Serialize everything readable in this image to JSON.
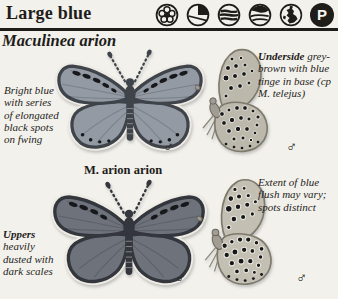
{
  "colors": {
    "paper": "#f2f1ec",
    "ink": "#1f1d1a",
    "wing_top": "#939aa4",
    "wing_top_margin": "#3f434a",
    "wing_bottom": "#6e727a",
    "wing_bottom_margin": "#33363c",
    "underside_top": "#bcb8ac",
    "underside_bottom": "#c3bfb2",
    "underside_edge": "#7d796d",
    "spot": "#17181b",
    "fringe": "#edebe4"
  },
  "header": {
    "title": "Large blue",
    "protected_letter": "P",
    "icons": [
      {
        "name": "flower-habitat-icon"
      },
      {
        "name": "coastal-slope-habitat-icon"
      },
      {
        "name": "wetland-habitat-icon"
      },
      {
        "name": "river-habitat-icon"
      },
      {
        "name": "britain-distribution-icon"
      },
      {
        "name": "protected-status-icon"
      }
    ]
  },
  "species": {
    "name": "Maculinea arion",
    "subspecies_label": "M. arion arion",
    "male_symbol": "♂"
  },
  "captions": {
    "forewing": "Bright blue with series of elongated black spots on fwing",
    "underside_lead": "Underside",
    "underside_rest": "grey-brown with blue tinge in base (cp M. telejus)",
    "uppers_lead": "Uppers",
    "uppers_rest": "heavily dusted with dark scales",
    "blue_flush": "Extent of blue flush may vary; spots distinct"
  }
}
